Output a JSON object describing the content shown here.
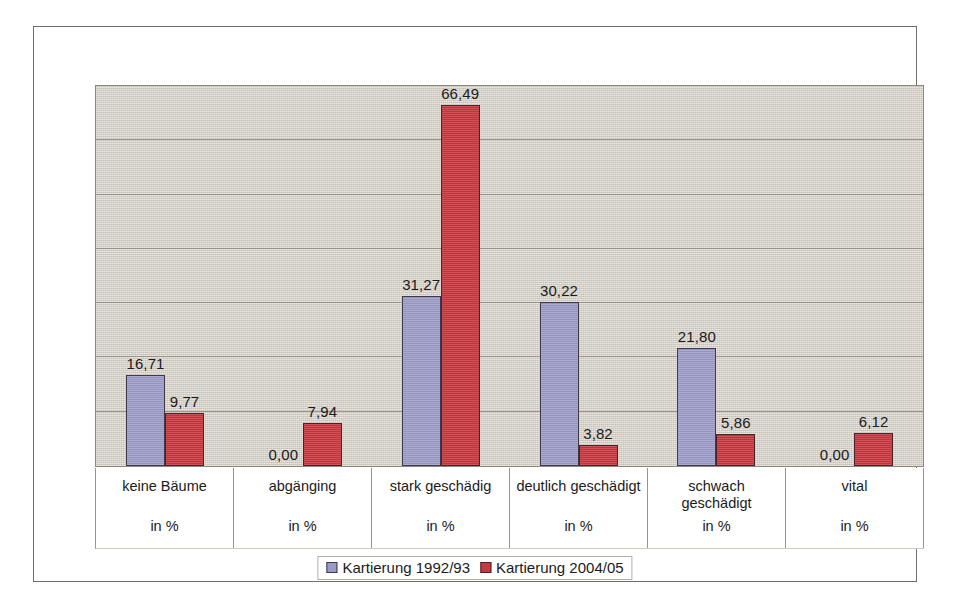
{
  "chart_data": {
    "type": "bar",
    "title": "",
    "subtitle": "",
    "xlabel": "",
    "ylabel": "",
    "unit_label": "in %",
    "ylim": [
      0,
      70
    ],
    "grid": true,
    "gridline_count": 7,
    "gridline_step": 10,
    "legend_position": "bottom",
    "categories": [
      "keine Bäume",
      "abgänging",
      "stark geschädig",
      "deutlich geschädigt",
      "schwach\ngeschädigt",
      "vital"
    ],
    "series": [
      {
        "name": "Kartierung 1992/93",
        "color": "#9c9bc8",
        "values": [
          16.71,
          0.0,
          31.27,
          30.22,
          21.8,
          0.0
        ],
        "labels": [
          "16,71",
          "0,00",
          "31,27",
          "30,22",
          "21,80",
          "0,00"
        ]
      },
      {
        "name": "Kartierung 2004/05",
        "color": "#c8383f",
        "values": [
          9.77,
          7.94,
          66.49,
          3.82,
          5.86,
          6.12
        ],
        "labels": [
          "9,77",
          "7,94",
          "66,49",
          "3,82",
          "5,86",
          "6,12"
        ]
      }
    ]
  },
  "colors": {
    "plot_background": "#d6d0c5",
    "gridline": "#8f8a80",
    "frame": "#6d6d6d",
    "series_0": "#9c9bc8",
    "series_1": "#c8383f",
    "text": "#1b1b1b"
  }
}
